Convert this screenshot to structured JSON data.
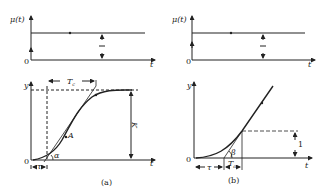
{
  "panels": [
    {
      "caption": "(a)",
      "input_plot": {
        "ylabel": "μ(t)",
        "xlabel": "t",
        "origin": "0",
        "step_height_label": "1"
      },
      "response_plot": {
        "ylabel": "y",
        "xlabel": "t",
        "origin": "0",
        "time_constant_label": "T",
        "time_constant_sub": "c",
        "delay_label": "τ",
        "inflection_label": "A",
        "angle_label": "α",
        "gain_label": "K"
      }
    },
    {
      "caption": "(b)",
      "input_plot": {
        "ylabel": "μ(t)",
        "xlabel": "t",
        "origin": "0",
        "step_height_label": "1"
      },
      "response_plot": {
        "ylabel": "y",
        "xlabel": "t",
        "origin": "0",
        "time_constant_label": "T",
        "time_constant_sub": "a",
        "delay_label": "τ",
        "angle_label": "β",
        "unit_label": "1"
      }
    }
  ]
}
